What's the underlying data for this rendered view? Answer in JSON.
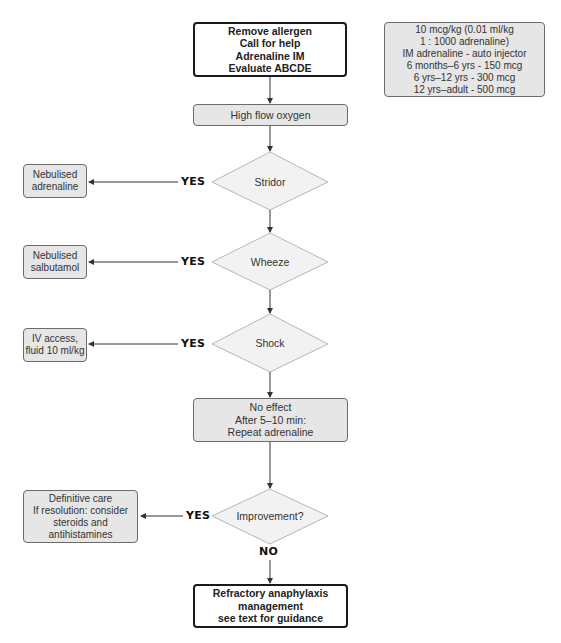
{
  "flowchart": {
    "start_box": {
      "lines": [
        "Remove allergen",
        "Call for help",
        "Adrenaline IM",
        "Evaluate ABCDE"
      ]
    },
    "dosing_box": {
      "lines": [
        "10 mcg/kg (0.01 ml/kg",
        "1 : 1000 adrenaline)",
        "IM adrenaline - auto injector",
        "6 months–6 yrs - 150 mcg",
        "6 yrs–12 yrs - 300 mcg",
        "12 yrs–adult - 500 mcg"
      ]
    },
    "oxygen_box": {
      "label": "High flow oxygen"
    },
    "decisions": [
      {
        "label": "Stridor",
        "yes_label": "YES",
        "action_lines": [
          "Nebulised",
          "adrenaline"
        ]
      },
      {
        "label": "Wheeze",
        "yes_label": "YES",
        "action_lines": [
          "Nebulised",
          "salbutamol"
        ]
      },
      {
        "label": "Shock",
        "yes_label": "YES",
        "action_lines": [
          "IV access,",
          "fluid 10 ml/kg"
        ]
      }
    ],
    "no_effect_box": {
      "lines": [
        "No effect",
        "After 5–10 min:",
        "Repeat adrenaline"
      ]
    },
    "improvement": {
      "label": "Improvement?",
      "yes_label": "YES",
      "no_label": "NO",
      "action_lines": [
        "Definitive care",
        "If resolution: consider",
        "steroids and",
        "antihistamines"
      ]
    },
    "refractory_box": {
      "lines": [
        "Refractory anaphylaxis",
        "management",
        "see text for guidance"
      ]
    }
  },
  "colors": {
    "box_fill": "#e6e6e6",
    "box_border": "#6b6b6b",
    "bold_border": "#1a1a1a",
    "diamond_fill": "#f2f2f2",
    "diamond_border": "#b5b5b5",
    "arrow": "#333333"
  }
}
